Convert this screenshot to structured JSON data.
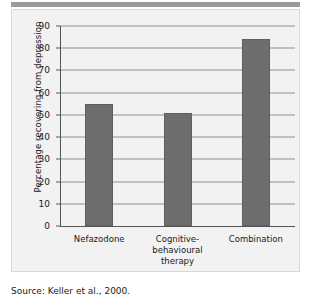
{
  "figure": {
    "source_text": "Source: Keller et al., 2000.",
    "bar_color": "#6e6e6e",
    "grid_color": "#8d8d8d",
    "panel_color": "#f2f2f2",
    "rule_color": "#9a9a9a"
  },
  "chart_data": {
    "type": "bar",
    "title": "",
    "xlabel": "",
    "ylabel": "Percentage recovering from depression",
    "categories": [
      "Nefazodone",
      "Cognitive-\nbehavioural\ntherapy",
      "Combination"
    ],
    "values": [
      55,
      51,
      84
    ],
    "ylim": [
      0,
      90
    ],
    "yticks": [
      0,
      10,
      20,
      30,
      40,
      50,
      60,
      70,
      80,
      90
    ],
    "ytick_labels": [
      "0",
      "10",
      "20",
      "30",
      "40",
      "50",
      "60",
      "70",
      "80",
      "90"
    ],
    "grid": true,
    "legend": "none"
  }
}
